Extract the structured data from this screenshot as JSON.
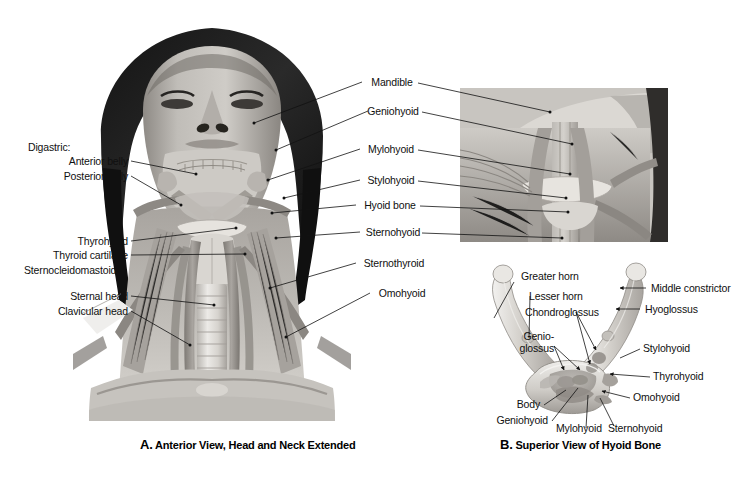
{
  "figure": {
    "background": "#ffffff",
    "ink": "#111111"
  },
  "panel_a": {
    "caption_letter": "A.",
    "caption_text": "Anterior View, Head and Neck Extended",
    "left_labels": [
      {
        "text": "Digastric:",
        "heading": true
      },
      {
        "text": "Anterior belly",
        "heading": false
      },
      {
        "text": "Posterior belly",
        "heading": false
      },
      {
        "text": "Thyrohyoid",
        "heading": false
      },
      {
        "text": "Thyroid cartilage",
        "heading": false
      },
      {
        "text": "Sternocleidomastoid:",
        "heading": true
      },
      {
        "text": "Sternal head",
        "heading": false
      },
      {
        "text": "Clavicular head",
        "heading": false
      }
    ],
    "center_labels": [
      {
        "text": "Mandible"
      },
      {
        "text": "Geniohyoid"
      },
      {
        "text": "Mylohyoid"
      },
      {
        "text": "Stylohyoid"
      },
      {
        "text": "Hyoid bone"
      },
      {
        "text": "Sternohyoid"
      },
      {
        "text": "Sternothyroid"
      },
      {
        "text": "Omohyoid"
      }
    ]
  },
  "panel_inset": {
    "name": "lateral-closeup-inset"
  },
  "panel_b": {
    "caption_letter": "B.",
    "caption_text": "Superior View of Hyoid Bone",
    "labels_left": [
      {
        "text": "Greater horn"
      },
      {
        "text": "Lesser horn"
      },
      {
        "text": "Chondroglossus"
      },
      {
        "text": "Genio-"
      },
      {
        "text": "glossus"
      }
    ],
    "labels_right": [
      {
        "text": "Middle constrictor"
      },
      {
        "text": "Hyoglossus"
      },
      {
        "text": "Stylohyoid"
      },
      {
        "text": "Thyrohyoid"
      },
      {
        "text": "Omohyoid"
      }
    ],
    "labels_bottom": [
      {
        "text": "Body"
      },
      {
        "text": "Geniohyoid"
      },
      {
        "text": "Mylohyoid"
      },
      {
        "text": "Sternohyoid"
      }
    ]
  }
}
